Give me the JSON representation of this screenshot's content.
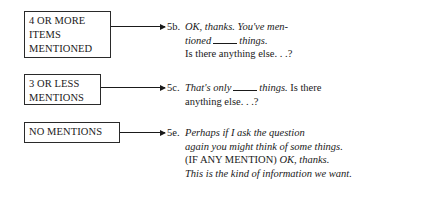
{
  "branches": [
    {
      "condition_lines": [
        "4 OR MORE",
        "ITEMS",
        "MENTIONED"
      ],
      "number": "5b.",
      "response_lines": [
        [
          {
            "t": "OK, thanks. You've men-",
            "i": true
          }
        ],
        [
          {
            "t": "tioned",
            "i": true
          },
          {
            "blank": true
          },
          {
            "t": "things.",
            "i": true
          }
        ],
        [
          {
            "t": "Is there anything else. . .?",
            "i": false
          }
        ]
      ]
    },
    {
      "condition_lines": [
        "3 OR LESS",
        "MENTIONS"
      ],
      "number": "5c.",
      "response_lines": [
        [
          {
            "t": "That's only",
            "i": true
          },
          {
            "blank": true
          },
          {
            "t": "things.",
            "i": true
          },
          {
            "t": " Is there",
            "i": false
          }
        ],
        [
          {
            "t": "anything else. . .?",
            "i": false
          }
        ]
      ]
    },
    {
      "condition_lines": [
        "NO MENTIONS"
      ],
      "number": "5e.",
      "response_lines": [
        [
          {
            "t": "Perhaps if I ask the question",
            "i": true
          }
        ],
        [
          {
            "t": "again you might think of some things.",
            "i": true
          }
        ],
        [
          {
            "t": "(IF ANY MENTION) ",
            "i": false
          },
          {
            "t": "OK, thanks.",
            "i": true
          }
        ],
        [
          {
            "t": "This is the kind of information we want.",
            "i": true
          }
        ]
      ]
    }
  ]
}
